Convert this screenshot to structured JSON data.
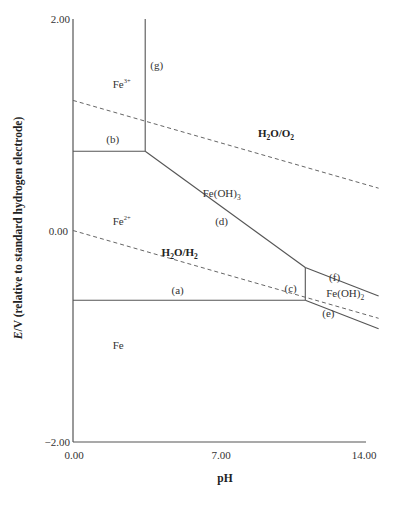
{
  "chart_data": {
    "type": "line",
    "title": "",
    "xlabel": "pH",
    "ylabel_italic": "E",
    "ylabel_rest": "/V (relative to standard hydrogen electrode)",
    "xlim": [
      0,
      14
    ],
    "ylim": [
      -2,
      2
    ],
    "x_ticks": [
      "0.00",
      "7.00",
      "14.00"
    ],
    "y_ticks": [
      "2.00",
      "0.00",
      "−2.00"
    ],
    "grid": false,
    "boundaries": [
      {
        "id": "g",
        "label": "(g)",
        "style": "solid",
        "points": [
          [
            3.45,
            2.0
          ],
          [
            3.45,
            0.75
          ]
        ]
      },
      {
        "id": "b",
        "label": "(b)",
        "style": "solid",
        "points": [
          [
            0.0,
            0.75
          ],
          [
            3.45,
            0.75
          ]
        ]
      },
      {
        "id": "d",
        "label": "(d)",
        "style": "solid",
        "points": [
          [
            3.45,
            0.75
          ],
          [
            11.1,
            -0.35
          ]
        ]
      },
      {
        "id": "a",
        "label": "(a)",
        "style": "solid",
        "points": [
          [
            0.0,
            -0.66
          ],
          [
            11.1,
            -0.66
          ]
        ]
      },
      {
        "id": "c",
        "label": "(c)",
        "style": "solid",
        "points": [
          [
            11.1,
            -0.35
          ],
          [
            11.1,
            -0.66
          ]
        ]
      },
      {
        "id": "f",
        "label": "(f)",
        "style": "solid",
        "points": [
          [
            11.1,
            -0.35
          ],
          [
            14.6,
            -0.62
          ]
        ]
      },
      {
        "id": "e",
        "label": "(e)",
        "style": "solid",
        "points": [
          [
            11.1,
            -0.66
          ],
          [
            14.6,
            -0.93
          ]
        ]
      }
    ],
    "water_lines": [
      {
        "id": "o2",
        "label": "H2O/O2",
        "style": "dashed",
        "points": [
          [
            0.0,
            1.23
          ],
          [
            14.6,
            0.4
          ]
        ]
      },
      {
        "id": "h2",
        "label": "H2O/H2",
        "style": "dashed",
        "points": [
          [
            0.0,
            0.0
          ],
          [
            14.6,
            -0.83
          ]
        ]
      }
    ],
    "regions": [
      {
        "species": "Fe3+",
        "base": "Fe",
        "sup": "3+",
        "at": [
          1.9,
          1.35
        ]
      },
      {
        "species": "Fe2+",
        "base": "Fe",
        "sup": "2+",
        "at": [
          1.9,
          0.05
        ]
      },
      {
        "species": "Fe(OH)3",
        "base": "Fe(OH)",
        "sub": "3",
        "at": [
          6.2,
          0.32
        ]
      },
      {
        "species": "Fe(OH)2",
        "base": "Fe(OH)",
        "sub": "2",
        "at": [
          12.1,
          -0.63
        ]
      },
      {
        "species": "Fe",
        "base": "Fe",
        "at": [
          1.9,
          -1.12
        ]
      }
    ],
    "boundary_labels": [
      {
        "text": "(g)",
        "at": [
          4.0,
          1.53
        ]
      },
      {
        "text": "(b)",
        "at": [
          1.9,
          0.83
        ]
      },
      {
        "text": "(d)",
        "at": [
          7.1,
          0.05
        ]
      },
      {
        "text": "(a)",
        "at": [
          5.0,
          -0.6
        ]
      },
      {
        "text": "(c)",
        "at": [
          10.4,
          -0.58
        ]
      },
      {
        "text": "(f)",
        "at": [
          12.5,
          -0.48
        ]
      },
      {
        "text": "(e)",
        "at": [
          12.2,
          -0.82
        ]
      }
    ],
    "water_labels": [
      {
        "base": "H",
        "sub1": "2",
        "mid": "O/O",
        "sub2": "2",
        "at": [
          9.7,
          0.88
        ]
      },
      {
        "base": "H",
        "sub1": "2",
        "mid": "O/H",
        "sub2": "2",
        "at": [
          5.1,
          -0.24
        ]
      }
    ]
  }
}
